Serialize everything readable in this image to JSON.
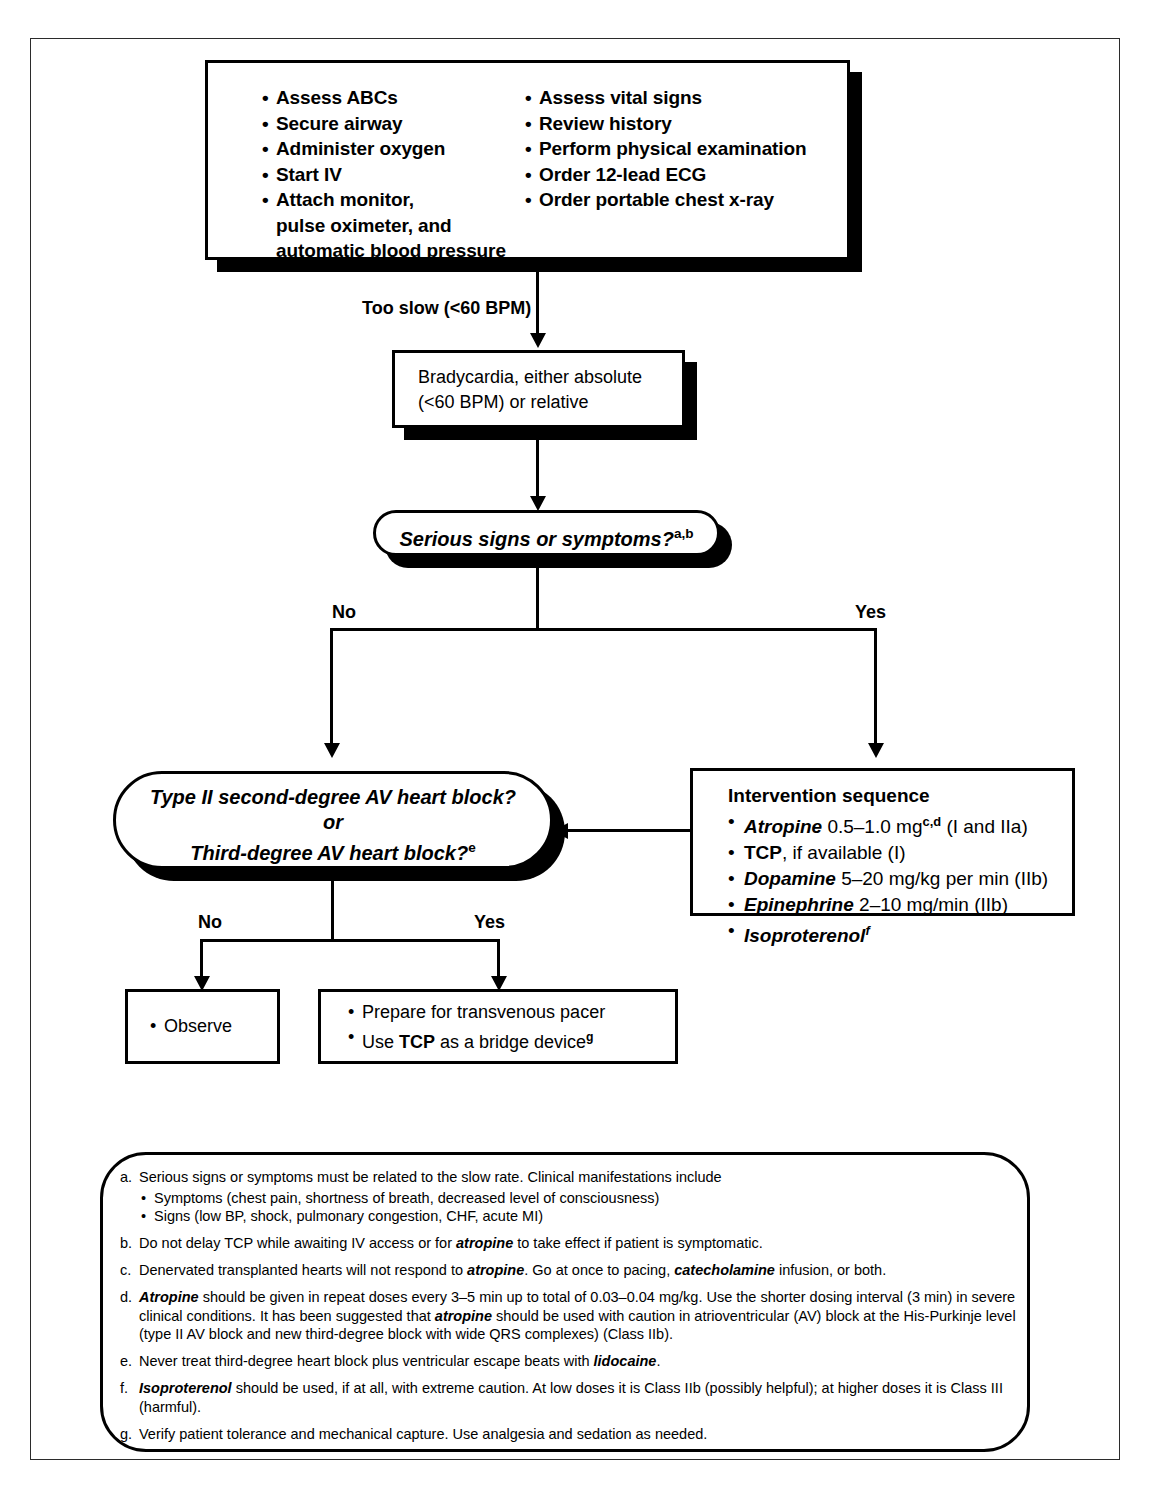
{
  "diagram": {
    "colors": {
      "ink": "#000000",
      "frame": "#2b2b2b",
      "paper": "#ffffff"
    },
    "initial_assessment": {
      "left_column": [
        "Assess ABCs",
        "Secure airway",
        "Administer oxygen",
        "Start IV",
        "Attach monitor,",
        "pulse oximeter, and",
        "automatic blood pressure"
      ],
      "right_column": [
        "Assess vital signs",
        "Review history",
        "Perform physical examination",
        "Order 12-lead ECG",
        "Order portable chest x-ray"
      ]
    },
    "edge_too_slow": "Too slow (<60 BPM)",
    "bradycardia_box": {
      "line1": "Bradycardia, either absolute",
      "line2": "(<60 BPM) or relative"
    },
    "decision_symptoms": {
      "text": "Serious signs or symptoms?",
      "footnote_marks": "a,b"
    },
    "branch_symptoms": {
      "no": "No",
      "yes": "Yes"
    },
    "decision_block": {
      "line1": "Type II second-degree AV heart block?",
      "line2": "or",
      "line3": "Third-degree AV heart block?",
      "footnote_mark": "e"
    },
    "branch_block": {
      "no": "No",
      "yes": "Yes"
    },
    "intervention": {
      "title": "Intervention sequence",
      "items": [
        {
          "drug": "Atropine",
          "rest": " 0.5–1.0 mg",
          "sup": "c,d",
          "tail": " (I and IIa)"
        },
        {
          "drug": "TCP",
          "drug_style": "bold",
          "rest": ", if available (I)",
          "sup": "",
          "tail": ""
        },
        {
          "drug": "Dopamine",
          "rest": " 5–20 mg/kg per min (IIb)",
          "sup": "",
          "tail": ""
        },
        {
          "drug": "Epinephrine",
          "rest": " 2–10 mg/min (IIb)",
          "sup": "",
          "tail": ""
        },
        {
          "drug": "Isoproterenol",
          "rest": "",
          "sup": "f",
          "tail": ""
        }
      ]
    },
    "observe_box": {
      "items": [
        "Observe"
      ]
    },
    "pacer_box": {
      "line1": "Prepare for transvenous pacer",
      "line2_pre": "Use ",
      "line2_bold": "TCP",
      "line2_post": " as a bridge device",
      "line2_sup": "g"
    },
    "footnotes": {
      "a": {
        "mark": "a.",
        "text": "Serious signs or symptoms must be related to the slow rate. Clinical manifestations include",
        "sub": [
          "Symptoms (chest pain, shortness of breath, decreased level of consciousness)",
          "Signs (low BP, shock, pulmonary congestion, CHF, acute MI)"
        ]
      },
      "b": {
        "mark": "b.",
        "pre": "Do not delay TCP while awaiting IV access or for ",
        "em": "atropine",
        "post": " to take effect if patient is symptomatic."
      },
      "c": {
        "mark": "c.",
        "pre": "Denervated transplanted hearts will not respond to ",
        "em": "atropine",
        "mid": ". Go at once to pacing, ",
        "em2": "catecholamine",
        "post": " infusion, or both."
      },
      "d": {
        "mark": "d.",
        "em": "Atropine",
        "pre": " should be given in repeat doses every 3–5 min up to total of 0.03–0.04 mg/kg. Use the shorter dosing interval (3 min) in severe clinical conditions. It has been suggested that ",
        "em2": "atropine",
        "post": " should be used with caution in atrioventricular (AV) block at the His-Purkinje level (type II AV block and new third-degree block with wide QRS complexes) (Class IIb)."
      },
      "e": {
        "mark": "e.",
        "pre": "Never treat third-degree heart block plus ventricular escape beats with ",
        "em": "lidocaine",
        "post": "."
      },
      "f": {
        "mark": "f.",
        "em": "Isoproterenol",
        "post": " should be used, if at all, with extreme caution. At low doses it is Class IIb (possibly helpful); at higher doses it is Class III (harmful)."
      },
      "g": {
        "mark": "g.",
        "text": "Verify patient tolerance and mechanical capture. Use analgesia and sedation as needed."
      }
    }
  }
}
